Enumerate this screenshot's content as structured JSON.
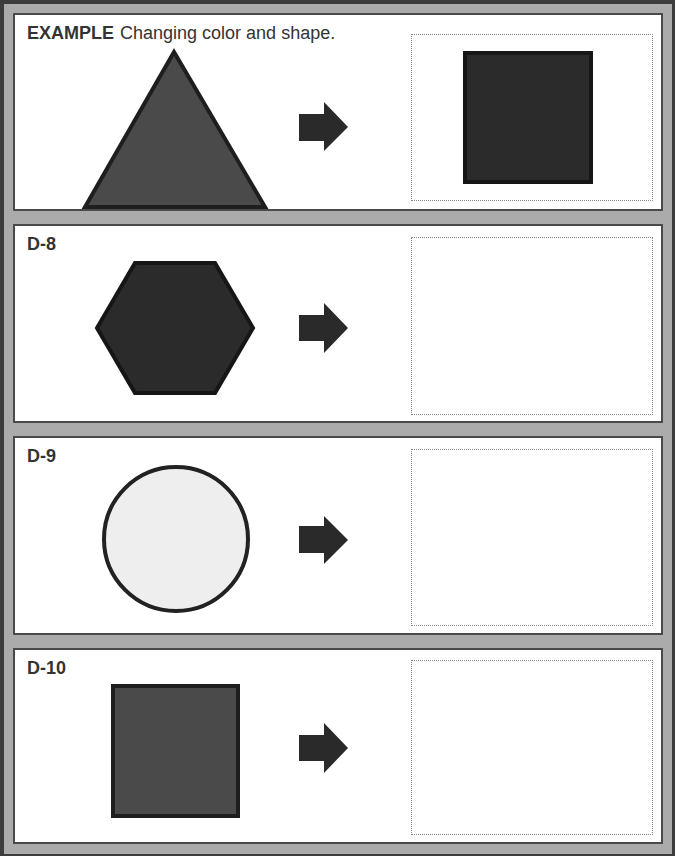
{
  "worksheet": {
    "panels": [
      {
        "id": "example",
        "label": "EXAMPLE",
        "instruction": "Changing color and shape.",
        "source_shape": {
          "type": "triangle",
          "fill": "#4a4a4a",
          "stroke": "#1e1e1e"
        },
        "arrow": "right-arrow",
        "result_shape": {
          "type": "square",
          "fill": "#2b2b2b",
          "stroke": "#161616"
        }
      },
      {
        "id": "D-8",
        "label": "D-8",
        "source_shape": {
          "type": "hexagon",
          "fill": "#2b2b2b",
          "stroke": "#161616"
        },
        "arrow": "right-arrow",
        "result_shape": null
      },
      {
        "id": "D-9",
        "label": "D-9",
        "source_shape": {
          "type": "circle",
          "fill": "#eeeeee",
          "stroke": "#222222"
        },
        "arrow": "right-arrow",
        "result_shape": null
      },
      {
        "id": "D-10",
        "label": "D-10",
        "source_shape": {
          "type": "square",
          "fill": "#4a4a4a",
          "stroke": "#1e1e1e"
        },
        "arrow": "right-arrow",
        "result_shape": null
      }
    ],
    "colors": {
      "frame": "#ababab",
      "panel_border": "#4a4a4a",
      "arrow": "#2a2a2a",
      "dotted_box": "#8a8a8a"
    }
  }
}
